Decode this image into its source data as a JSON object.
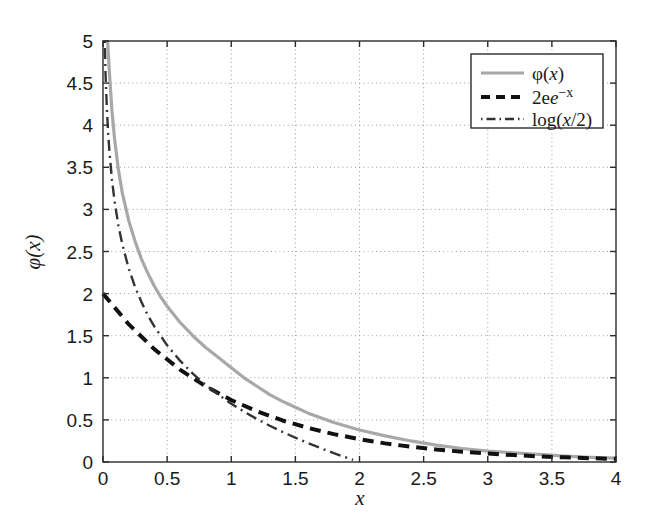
{
  "chart_data": {
    "type": "line",
    "title": "",
    "xlabel": "x",
    "ylabel": "φ(x)",
    "xlim": [
      0,
      4
    ],
    "ylim": [
      0,
      5
    ],
    "grid": true,
    "legend_position": "top-right",
    "xticks": [
      0,
      0.5,
      1,
      1.5,
      2,
      2.5,
      3,
      3.5,
      4
    ],
    "xtick_labels": [
      "0",
      "0.5",
      "1",
      "1.5",
      "2",
      "2.5",
      "3",
      "3.5",
      "4"
    ],
    "yticks": [
      0,
      0.5,
      1,
      1.5,
      2,
      2.5,
      3,
      3.5,
      4,
      4.5,
      5
    ],
    "ytick_labels": [
      "0",
      "0.5",
      "1",
      "1.5",
      "2",
      "2.5",
      "3",
      "3.5",
      "4",
      "4.5",
      "5"
    ],
    "series": [
      {
        "name": "phi",
        "legend_label": "φ(x)",
        "style": "solid",
        "color": "#a8a8a8",
        "width": 3.2,
        "x": [
          0.036,
          0.05,
          0.07,
          0.09,
          0.12,
          0.15,
          0.2,
          0.25,
          0.3,
          0.35,
          0.4,
          0.45,
          0.5,
          0.6,
          0.7,
          0.8,
          0.9,
          1.0,
          1.1,
          1.2,
          1.3,
          1.4,
          1.5,
          1.6,
          1.8,
          2.0,
          2.2,
          2.4,
          2.6,
          2.8,
          3.0,
          3.2,
          3.4,
          3.6,
          3.8,
          4.0
        ],
        "y": [
          5.0,
          4.62,
          4.17,
          3.84,
          3.47,
          3.2,
          2.87,
          2.62,
          2.41,
          2.24,
          2.09,
          1.96,
          1.85,
          1.66,
          1.5,
          1.36,
          1.24,
          1.12,
          1.0,
          0.9,
          0.8,
          0.72,
          0.65,
          0.58,
          0.47,
          0.38,
          0.31,
          0.25,
          0.2,
          0.16,
          0.13,
          0.11,
          0.09,
          0.07,
          0.055,
          0.045
        ]
      },
      {
        "name": "two-exp-neg-x",
        "legend_label": "2e^{-x}",
        "style": "dashed",
        "color": "#111111",
        "width": 4.0,
        "x": [
          0,
          0.2,
          0.4,
          0.6,
          0.8,
          1.0,
          1.2,
          1.4,
          1.6,
          1.8,
          2.0,
          2.2,
          2.4,
          2.6,
          2.8,
          3.0,
          3.2,
          3.4,
          3.6,
          3.8,
          4.0
        ],
        "y": [
          2.0,
          1.637,
          1.34,
          1.098,
          0.899,
          0.736,
          0.602,
          0.493,
          0.404,
          0.331,
          0.271,
          0.221,
          0.181,
          0.148,
          0.122,
          0.1,
          0.082,
          0.067,
          0.055,
          0.045,
          0.037
        ]
      },
      {
        "name": "log-x-over-2",
        "legend_label": "log(x/2)",
        "style": "dashdot",
        "color": "#333333",
        "width": 2.4,
        "comment": "-log(x/2) branch drawn from near 0 down to zero at x=2",
        "x": [
          0.0135,
          0.02,
          0.03,
          0.04,
          0.05,
          0.07,
          0.09,
          0.12,
          0.15,
          0.2,
          0.25,
          0.3,
          0.35,
          0.4,
          0.5,
          0.6,
          0.7,
          0.8,
          0.9,
          1.0,
          1.1,
          1.2,
          1.3,
          1.4,
          1.5,
          1.6,
          1.7,
          1.8,
          1.9,
          1.95
        ],
        "y": [
          5.0,
          4.6,
          4.2,
          3.91,
          3.69,
          3.35,
          3.1,
          2.81,
          2.59,
          2.3,
          2.08,
          1.9,
          1.74,
          1.61,
          1.386,
          1.204,
          1.05,
          0.916,
          0.799,
          0.693,
          0.598,
          0.511,
          0.431,
          0.357,
          0.288,
          0.223,
          0.163,
          0.105,
          0.051,
          0.025
        ]
      }
    ]
  },
  "legend": {
    "entries": [
      {
        "label": "φ(x)"
      },
      {
        "label_base": "2e",
        "label_exp": "−x"
      },
      {
        "label": "log(x/2)"
      }
    ]
  }
}
